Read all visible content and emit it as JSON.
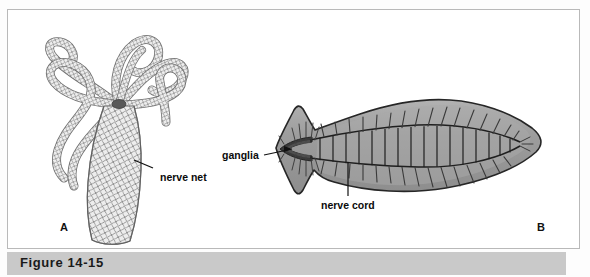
{
  "figure": {
    "caption": "Figure 14-15",
    "panels": [
      {
        "letter": "A",
        "subject": "hydra-nerve-net"
      },
      {
        "letter": "B",
        "subject": "flatworm-nerve-cord"
      }
    ],
    "callouts": [
      {
        "id": "nerve-net",
        "text": "nerve net",
        "points_to": "hydra-body-column"
      },
      {
        "id": "ganglia",
        "text": "ganglia",
        "points_to": "flatworm-head-ganglia"
      },
      {
        "id": "nerve-cord",
        "text": "nerve cord",
        "points_to": "flatworm-ventral-nerve-cord"
      }
    ]
  },
  "colors": {
    "page_background": "#ffffff",
    "frame_border": "#b9b9b9",
    "caption_band": "#c9c9c9",
    "caption_text": "#1a1a1a",
    "label_text": "#0b0b0b",
    "worm_body_fill": "#9a9a9a",
    "worm_body_light": "#b5b5b5",
    "worm_outline": "#2b2b2b",
    "ganglia_dark": "#3a3a3a",
    "hydra_mesh": "#6e6e6e",
    "hydra_fill": "#e8e8e8"
  }
}
